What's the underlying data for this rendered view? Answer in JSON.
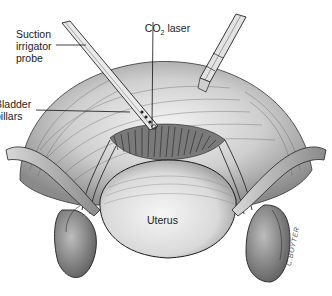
{
  "figure": {
    "type": "medical-illustration",
    "labels": {
      "suction_probe": "Suction\nirrigator\nprobe",
      "co2_laser_prefix": "CO",
      "co2_laser_sub": "2",
      "co2_laser_suffix": " laser",
      "bladder_pillars": "Bladder\npillars",
      "uterus": "Uterus"
    },
    "signature": "C.BOYTER",
    "colors": {
      "ink": "#1a1a1a",
      "tissue_light": "#e6e6e6",
      "tissue_mid": "#b8b8b8",
      "tissue_dark": "#6e6e6e",
      "background": "#ffffff"
    }
  }
}
